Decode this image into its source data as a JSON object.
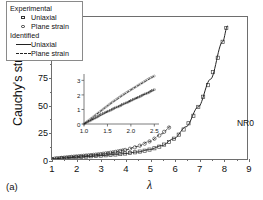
{
  "figure": {
    "panel_tag": "(a)",
    "sample_label": "NR0"
  },
  "axes": {
    "ylabel": "Cauchy's stress [MPa]",
    "xlabel": "λ",
    "yticks": [
      0,
      25,
      50,
      75,
      100,
      125
    ],
    "xticks": [
      1,
      2,
      3,
      4,
      5,
      6,
      7,
      8,
      9
    ],
    "xlim": [
      1,
      9
    ],
    "ylim": [
      0,
      130
    ]
  },
  "legend": {
    "group_experimental": "Experimental",
    "group_identified": "Identified",
    "exp_uniaxial": "Uniaxial",
    "exp_plane_strain": "Plane strain",
    "id_uniaxial": "Uniaxial",
    "id_plane_strain": "Plane strain"
  },
  "inset": {
    "yticks": [
      0,
      1,
      2,
      3
    ],
    "xticks": [
      "1.0",
      "1.5",
      "2.0",
      "2.5"
    ],
    "xlim": [
      1.0,
      2.6
    ],
    "ylim": [
      0,
      3.3
    ]
  },
  "chart_data": {
    "type": "line",
    "title": "",
    "xlabel": "λ",
    "ylabel": "Cauchy's stress [MPa]",
    "xlim": [
      1,
      9
    ],
    "ylim": [
      0,
      130
    ],
    "grid": false,
    "legend_position": "upper-left",
    "annotations": [
      "NR0",
      "(a)"
    ],
    "series": [
      {
        "name": "Experimental Uniaxial",
        "style": "markers",
        "marker": "square",
        "x": [
          1.0,
          1.2,
          1.4,
          1.6,
          1.8,
          2.0,
          2.2,
          2.4,
          2.6,
          2.8,
          3.0,
          3.2,
          3.4,
          3.6,
          3.8,
          4.0,
          4.2,
          4.4,
          4.6,
          4.8,
          5.0,
          5.2,
          5.4,
          5.6,
          5.8,
          6.0,
          6.2,
          6.4,
          6.6,
          6.8,
          7.0,
          7.2,
          7.4,
          7.6,
          7.8,
          8.0,
          8.15
        ],
        "y": [
          0.0,
          0.35,
          0.7,
          1.0,
          1.3,
          1.6,
          1.9,
          2.2,
          2.5,
          2.8,
          3.1,
          3.4,
          3.8,
          4.1,
          4.5,
          5.0,
          5.5,
          6.1,
          6.8,
          7.6,
          8.6,
          9.8,
          11.3,
          13.2,
          15.6,
          18.6,
          22.3,
          27.0,
          32.7,
          39.6,
          47.7,
          57.0,
          67.6,
          79.5,
          92.7,
          107.3,
          120.0
        ]
      },
      {
        "name": "Experimental Plane strain",
        "style": "markers",
        "marker": "circle",
        "x": [
          1.0,
          1.1,
          1.2,
          1.3,
          1.4,
          1.5,
          1.6,
          1.7,
          1.8,
          1.9,
          2.0,
          2.1,
          2.2,
          2.3,
          2.4,
          2.5,
          2.6,
          2.7,
          2.8,
          2.9,
          3.0,
          3.1,
          3.2,
          3.3,
          3.4,
          3.5,
          3.6,
          3.7,
          3.8,
          3.9,
          4.0,
          4.2,
          4.4,
          4.6,
          4.8,
          5.0,
          5.2,
          5.4,
          5.6,
          5.8
        ],
        "y": [
          0.0,
          0.25,
          0.5,
          0.75,
          1.0,
          1.25,
          1.5,
          1.72,
          1.95,
          2.15,
          2.35,
          2.55,
          2.75,
          2.95,
          3.15,
          3.35,
          3.55,
          3.78,
          4.0,
          4.25,
          4.5,
          4.8,
          5.1,
          5.4,
          5.75,
          6.1,
          6.5,
          6.9,
          7.35,
          7.8,
          8.3,
          9.4,
          10.7,
          12.2,
          14.0,
          16.1,
          18.6,
          21.5,
          24.9,
          28.8
        ]
      },
      {
        "name": "Identified Uniaxial",
        "style": "solid-line",
        "x": [
          1.0,
          1.5,
          2.0,
          2.5,
          3.0,
          3.5,
          4.0,
          4.5,
          5.0,
          5.5,
          6.0,
          6.5,
          7.0,
          7.5,
          8.0,
          8.2
        ],
        "y": [
          0.0,
          0.85,
          1.6,
          2.35,
          3.1,
          3.95,
          5.0,
          6.4,
          8.6,
          12.2,
          18.6,
          29.5,
          47.7,
          73.0,
          107.3,
          122.0
        ]
      },
      {
        "name": "Identified Plane strain",
        "style": "dashed-line",
        "x": [
          1.0,
          1.5,
          2.0,
          2.5,
          3.0,
          3.5,
          4.0,
          4.5,
          5.0,
          5.5,
          5.85
        ],
        "y": [
          0.0,
          1.25,
          2.35,
          3.35,
          4.5,
          6.1,
          8.3,
          11.4,
          16.1,
          23.0,
          29.5
        ]
      }
    ],
    "inset": {
      "type": "line",
      "xlim": [
        1.0,
        2.6
      ],
      "ylim": [
        0,
        3.3
      ],
      "xticks": [
        1.0,
        1.5,
        2.0,
        2.5
      ],
      "yticks": [
        0,
        1,
        2,
        3
      ],
      "series": [
        {
          "name": "Experimental Plane strain",
          "marker": "circle",
          "x": [
            1.0,
            1.1,
            1.2,
            1.3,
            1.4,
            1.5,
            1.6,
            1.7,
            1.8,
            1.9,
            2.0,
            2.1,
            2.2,
            2.3,
            2.4,
            2.5
          ],
          "y": [
            0.0,
            0.25,
            0.5,
            0.75,
            1.0,
            1.25,
            1.5,
            1.72,
            1.95,
            2.15,
            2.35,
            2.55,
            2.75,
            2.95,
            3.15,
            3.3
          ]
        },
        {
          "name": "Experimental Uniaxial",
          "marker": "square",
          "x": [
            1.0,
            1.1,
            1.2,
            1.3,
            1.4,
            1.5,
            1.6,
            1.7,
            1.8,
            1.9,
            2.0,
            2.1,
            2.2,
            2.3,
            2.4,
            2.5
          ],
          "y": [
            0.0,
            0.18,
            0.35,
            0.52,
            0.7,
            0.85,
            1.0,
            1.15,
            1.3,
            1.45,
            1.6,
            1.75,
            1.9,
            2.05,
            2.2,
            2.35
          ]
        },
        {
          "name": "Identified Plane strain",
          "style": "dashed-line",
          "x": [
            1.0,
            1.5,
            2.0,
            2.5
          ],
          "y": [
            0.0,
            1.25,
            2.35,
            3.3
          ]
        },
        {
          "name": "Identified Uniaxial",
          "style": "solid-line",
          "x": [
            1.0,
            1.5,
            2.0,
            2.5
          ],
          "y": [
            0.0,
            0.85,
            1.6,
            2.35
          ]
        }
      ]
    }
  }
}
